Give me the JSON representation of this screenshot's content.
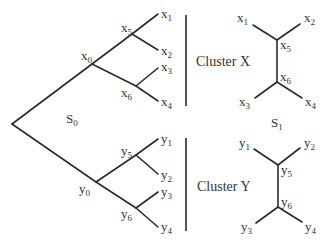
{
  "diagram": {
    "type": "phylogenetic-tree-clustering",
    "left_tree": {
      "label": {
        "base": "S",
        "sub": "0"
      },
      "nodes": {
        "x0": {
          "base": "x",
          "sub": "0"
        },
        "x5": {
          "base": "x",
          "sub": "5"
        },
        "x6": {
          "base": "x",
          "sub": "6"
        },
        "x1": {
          "base": "x",
          "sub": "1"
        },
        "x2": {
          "base": "x",
          "sub": "2"
        },
        "x3": {
          "base": "x",
          "sub": "3"
        },
        "x4": {
          "base": "x",
          "sub": "4"
        },
        "y0": {
          "base": "y",
          "sub": "0"
        },
        "y5": {
          "base": "y",
          "sub": "5"
        },
        "y6": {
          "base": "y",
          "sub": "6"
        },
        "y1": {
          "base": "y",
          "sub": "1"
        },
        "y2": {
          "base": "y",
          "sub": "2"
        },
        "y3": {
          "base": "y",
          "sub": "3"
        },
        "y4": {
          "base": "y",
          "sub": "4"
        }
      }
    },
    "clusters": [
      {
        "label": "Cluster X"
      },
      {
        "label": "Cluster Y"
      }
    ],
    "right_trees": {
      "label": {
        "base": "S",
        "sub": "1"
      },
      "x_tree": {
        "x1": {
          "base": "x",
          "sub": "1"
        },
        "x2": {
          "base": "x",
          "sub": "2"
        },
        "x5": {
          "base": "x",
          "sub": "5"
        },
        "x6": {
          "base": "x",
          "sub": "6"
        },
        "x3": {
          "base": "x",
          "sub": "3"
        },
        "x4": {
          "base": "x",
          "sub": "4"
        }
      },
      "y_tree": {
        "y1": {
          "base": "y",
          "sub": "1"
        },
        "y2": {
          "base": "y",
          "sub": "2"
        },
        "y5": {
          "base": "y",
          "sub": "5"
        },
        "y6": {
          "base": "y",
          "sub": "6"
        },
        "y3": {
          "base": "y",
          "sub": "3"
        },
        "y4": {
          "base": "y",
          "sub": "4"
        }
      }
    }
  }
}
